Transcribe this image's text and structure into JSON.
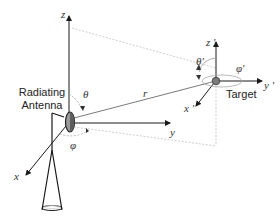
{
  "diagram": {
    "source_frame": {
      "label_lines": [
        "Radiating",
        "Antenna"
      ],
      "axes": {
        "x": "x",
        "y": "y",
        "z": "z"
      },
      "angles": {
        "theta": "θ",
        "phi": "φ"
      }
    },
    "distance_label": "r",
    "target_frame": {
      "label": "Target",
      "axes": {
        "x": "x '",
        "y": "y '",
        "z": "z '"
      },
      "angles": {
        "theta": "θ'",
        "phi": "φ'"
      }
    },
    "colors": {
      "axis": "#1a1a1a",
      "dashed": "#c8c8c8",
      "r_line": "#7a7a7a",
      "antenna_fill": "#8c8c8c",
      "target_fill": "#808080"
    }
  }
}
